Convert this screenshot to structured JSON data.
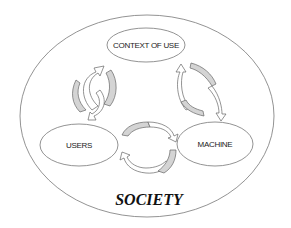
{
  "diagram": {
    "outer": {
      "label": "SOCIETY",
      "cx": 147,
      "cy": 116,
      "rx": 127,
      "ry": 101
    },
    "nodes": [
      {
        "id": "context",
        "label": "CONTEXT OF USE",
        "cx": 146,
        "cy": 45,
        "rx": 39,
        "ry": 17
      },
      {
        "id": "users",
        "label": "USERS",
        "cx": 79,
        "cy": 145,
        "rx": 39,
        "ry": 21
      },
      {
        "id": "machine",
        "label": "MACHINE",
        "cx": 215,
        "cy": 144,
        "rx": 38,
        "ry": 22
      }
    ],
    "cycles": [
      {
        "between": [
          "users",
          "context"
        ],
        "style": "bidirectional-curved-arrows"
      },
      {
        "between": [
          "context",
          "machine"
        ],
        "style": "bidirectional-curved-arrows"
      },
      {
        "between": [
          "users",
          "machine"
        ],
        "style": "bidirectional-curved-arrows"
      }
    ],
    "colors": {
      "stroke": "#777777",
      "arrow_fill": "#d4d4d4",
      "background": "#ffffff"
    }
  }
}
